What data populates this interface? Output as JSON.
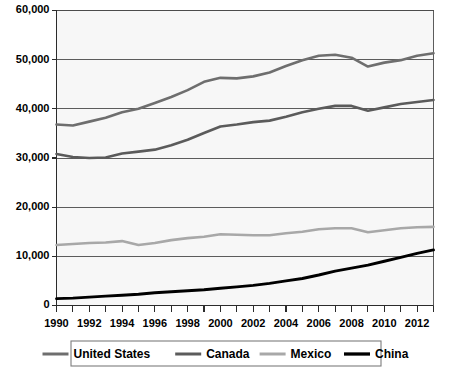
{
  "chart_data": {
    "type": "line",
    "title": "",
    "subtitle": "",
    "xlabel": "",
    "ylabel": "",
    "xlim": [
      1990,
      2013
    ],
    "ylim": [
      0,
      60000
    ],
    "grid": true,
    "legend_position": "bottom",
    "y_ticks": [
      0,
      10000,
      20000,
      30000,
      40000,
      50000,
      60000
    ],
    "y_tick_labels": [
      "0",
      "10,000",
      "20,000",
      "30,000",
      "40,000",
      "50,000",
      "60,000"
    ],
    "x": [
      1990,
      1991,
      1992,
      1993,
      1994,
      1995,
      1996,
      1997,
      1998,
      1999,
      2000,
      2001,
      2002,
      2003,
      2004,
      2005,
      2006,
      2007,
      2008,
      2009,
      2010,
      2011,
      2012,
      2013
    ],
    "x_tick_labels": [
      "1990",
      "1992",
      "1994",
      "1996",
      "1998",
      "2000",
      "2002",
      "2004",
      "2006",
      "2008",
      "2010",
      "2012"
    ],
    "x_tick_label_values": [
      1990,
      1992,
      1994,
      1996,
      1998,
      2000,
      2002,
      2004,
      2006,
      2008,
      2010,
      2012
    ],
    "series": [
      {
        "name": "United States",
        "color": "#6e6e6e",
        "width": 2.6,
        "values": [
          36800,
          36600,
          37400,
          38200,
          39300,
          40000,
          41200,
          42400,
          43800,
          45500,
          46300,
          46200,
          46600,
          47400,
          48700,
          49900,
          50800,
          51000,
          50400,
          48600,
          49400,
          49900,
          50800,
          51300
        ]
      },
      {
        "name": "Canada",
        "color": "#5b5b5b",
        "width": 2.6,
        "values": [
          30800,
          30200,
          30000,
          30100,
          30900,
          31300,
          31700,
          32600,
          33700,
          35100,
          36400,
          36800,
          37300,
          37600,
          38400,
          39300,
          40000,
          40600,
          40600,
          39600,
          40300,
          41000,
          41400,
          41800
        ]
      },
      {
        "name": "Mexico",
        "color": "#a8a8a8",
        "width": 2.6,
        "values": [
          12300,
          12500,
          12700,
          12800,
          13100,
          12300,
          12700,
          13300,
          13700,
          14000,
          14500,
          14400,
          14300,
          14300,
          14700,
          15000,
          15500,
          15700,
          15700,
          14900,
          15300,
          15700,
          15900,
          16000
        ]
      },
      {
        "name": "China",
        "color": "#000000",
        "width": 2.9,
        "values": [
          1400,
          1500,
          1700,
          1900,
          2100,
          2300,
          2600,
          2800,
          3000,
          3200,
          3500,
          3800,
          4100,
          4500,
          5000,
          5500,
          6200,
          7000,
          7600,
          8200,
          9000,
          9800,
          10600,
          11300
        ]
      }
    ],
    "legend": [
      {
        "label": "United States",
        "color": "#6e6e6e",
        "width": 2.6
      },
      {
        "label": "Canada",
        "color": "#5b5b5b",
        "width": 2.6
      },
      {
        "label": "Mexico",
        "color": "#a8a8a8",
        "width": 2.6
      },
      {
        "label": "China",
        "color": "#000000",
        "width": 2.9
      }
    ]
  }
}
